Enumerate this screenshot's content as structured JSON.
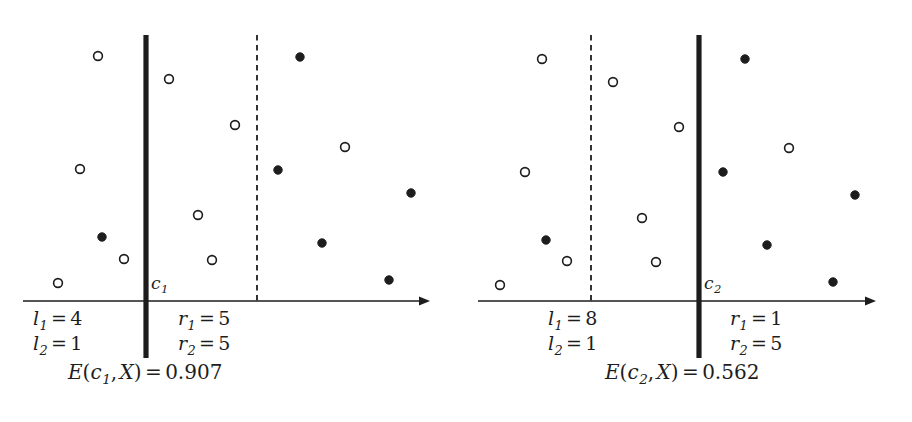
{
  "figure": {
    "width": 912,
    "height": 422,
    "background": "#ffffff",
    "ink": "#1d1d1d"
  },
  "panels": [
    {
      "id": "left",
      "cut_label": {
        "var": "c",
        "sub": "1"
      },
      "cut_label_pos": {
        "x": 151,
        "y": 275
      },
      "solid_cut_x": 146,
      "dashed_cut_x": 257,
      "axis": {
        "y": 301,
        "x_start": 23,
        "x_end": 430
      },
      "counts": [
        {
          "name": "l1",
          "var": "l",
          "sub": "1",
          "op": "=",
          "value": "4",
          "x": 33,
          "y": 309
        },
        {
          "name": "l2",
          "var": "l",
          "sub": "2",
          "op": "=",
          "value": "1",
          "x": 33,
          "y": 334
        },
        {
          "name": "r1",
          "var": "r",
          "sub": "1",
          "op": "=",
          "value": "5",
          "x": 178,
          "y": 309
        },
        {
          "name": "r2",
          "var": "r",
          "sub": "2",
          "op": "=",
          "value": "5",
          "x": 178,
          "y": 334
        }
      ],
      "entropy": {
        "func": "E",
        "arg_var": "c",
        "arg_sub": "1",
        "arg2": "X",
        "op": "=",
        "value": "0.907",
        "x": 68,
        "y": 362
      }
    },
    {
      "id": "right",
      "cut_label": {
        "var": "c",
        "sub": "2"
      },
      "cut_label_pos": {
        "x": 704,
        "y": 275
      },
      "solid_cut_x": 699,
      "dashed_cut_x": 591,
      "axis": {
        "y": 301,
        "x_start": 478,
        "x_end": 876
      },
      "counts": [
        {
          "name": "l1",
          "var": "l",
          "sub": "1",
          "op": "=",
          "value": "8",
          "x": 548,
          "y": 309
        },
        {
          "name": "l2",
          "var": "l",
          "sub": "2",
          "op": "=",
          "value": "1",
          "x": 548,
          "y": 334
        },
        {
          "name": "r1",
          "var": "r",
          "sub": "1",
          "op": "=",
          "value": "1",
          "x": 730,
          "y": 309
        },
        {
          "name": "r2",
          "var": "r",
          "sub": "2",
          "op": "=",
          "value": "5",
          "x": 730,
          "y": 334
        }
      ],
      "entropy": {
        "func": "E",
        "arg_var": "c",
        "arg_sub": "2",
        "arg2": "X",
        "op": "=",
        "value": "0.562",
        "x": 605,
        "y": 362
      }
    }
  ],
  "chart_data": {
    "type": "scatter",
    "title": "",
    "xlabel": "",
    "ylabel": "",
    "grid": false,
    "legend": "none",
    "classes": [
      {
        "name": "class-1",
        "marker": "open-circle",
        "fill": "#ffffff",
        "stroke": "#1d1d1d"
      },
      {
        "name": "class-2",
        "marker": "filled-circle",
        "fill": "#1d1d1d",
        "stroke": "#1d1d1d"
      }
    ],
    "panels": [
      {
        "id": "left",
        "cut": "c1",
        "solid_cut_x": 146,
        "dashed_cut_x": 257,
        "counts": {
          "l1": 4,
          "l2": 1,
          "r1": 5,
          "r2": 5
        },
        "entropy": 0.907,
        "points": [
          {
            "x": 98,
            "y": 56,
            "class": "class-1"
          },
          {
            "x": 169,
            "y": 79,
            "class": "class-1"
          },
          {
            "x": 300,
            "y": 57,
            "class": "class-2"
          },
          {
            "x": 235,
            "y": 125,
            "class": "class-1"
          },
          {
            "x": 345,
            "y": 147,
            "class": "class-1"
          },
          {
            "x": 80,
            "y": 169,
            "class": "class-1"
          },
          {
            "x": 278,
            "y": 170,
            "class": "class-2"
          },
          {
            "x": 411,
            "y": 193,
            "class": "class-2"
          },
          {
            "x": 198,
            "y": 215,
            "class": "class-1"
          },
          {
            "x": 102,
            "y": 237,
            "class": "class-2"
          },
          {
            "x": 322,
            "y": 243,
            "class": "class-2"
          },
          {
            "x": 124,
            "y": 259,
            "class": "class-1"
          },
          {
            "x": 212,
            "y": 260,
            "class": "class-1"
          },
          {
            "x": 389,
            "y": 280,
            "class": "class-2"
          },
          {
            "x": 58,
            "y": 283,
            "class": "class-1"
          }
        ]
      },
      {
        "id": "right",
        "cut": "c2",
        "solid_cut_x": 699,
        "dashed_cut_x": 591,
        "counts": {
          "l1": 8,
          "l2": 1,
          "r1": 1,
          "r2": 5
        },
        "entropy": 0.562,
        "points": [
          {
            "x": 542,
            "y": 59,
            "class": "class-1"
          },
          {
            "x": 613,
            "y": 82,
            "class": "class-1"
          },
          {
            "x": 745,
            "y": 59,
            "class": "class-2"
          },
          {
            "x": 679,
            "y": 127,
            "class": "class-1"
          },
          {
            "x": 789,
            "y": 148,
            "class": "class-1"
          },
          {
            "x": 525,
            "y": 172,
            "class": "class-1"
          },
          {
            "x": 723,
            "y": 172,
            "class": "class-2"
          },
          {
            "x": 855,
            "y": 195,
            "class": "class-2"
          },
          {
            "x": 642,
            "y": 218,
            "class": "class-1"
          },
          {
            "x": 546,
            "y": 240,
            "class": "class-2"
          },
          {
            "x": 767,
            "y": 245,
            "class": "class-2"
          },
          {
            "x": 567,
            "y": 261,
            "class": "class-1"
          },
          {
            "x": 656,
            "y": 262,
            "class": "class-1"
          },
          {
            "x": 833,
            "y": 282,
            "class": "class-2"
          },
          {
            "x": 500,
            "y": 285,
            "class": "class-1"
          }
        ]
      }
    ]
  }
}
